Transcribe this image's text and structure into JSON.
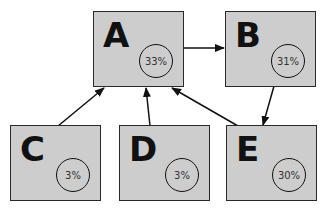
{
  "diagram": {
    "type": "directed-graph",
    "nodes": [
      {
        "id": "A",
        "label": "A",
        "percent": "33%"
      },
      {
        "id": "B",
        "label": "B",
        "percent": "31%"
      },
      {
        "id": "C",
        "label": "C",
        "percent": "3%"
      },
      {
        "id": "D",
        "label": "D",
        "percent": "3%"
      },
      {
        "id": "E",
        "label": "E",
        "percent": "30%"
      }
    ],
    "edges": [
      {
        "from": "A",
        "to": "B"
      },
      {
        "from": "B",
        "to": "E"
      },
      {
        "from": "C",
        "to": "A"
      },
      {
        "from": "D",
        "to": "A"
      },
      {
        "from": "E",
        "to": "A"
      }
    ],
    "colors": {
      "node_fill": "#cdcdcd",
      "node_border": "#2a2a2a",
      "edge": "#111111"
    }
  }
}
